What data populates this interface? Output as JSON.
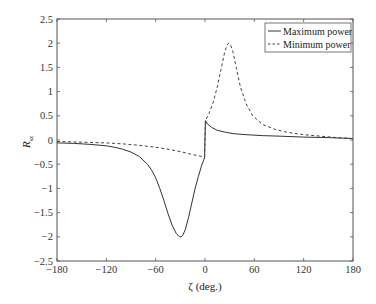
{
  "chart_data": {
    "type": "line",
    "title": "",
    "xlabel": "ζ (deg.)",
    "ylabel_main": "R",
    "ylabel_sub": "sz",
    "xlim": [
      -180,
      180
    ],
    "ylim": [
      -2.5,
      2.5
    ],
    "xticks": [
      -180,
      -120,
      -60,
      0,
      60,
      120,
      180
    ],
    "xtick_labels": [
      "−180",
      "−120",
      "−60",
      "0",
      "60",
      "120",
      "180"
    ],
    "yticks": [
      2.5,
      2,
      1.5,
      1,
      0.5,
      0,
      -0.5,
      -1,
      -1.5,
      -2,
      -2.5
    ],
    "ytick_labels": [
      "2.5",
      "2",
      "1.5",
      "1",
      "0.5",
      "0",
      "−0.5",
      "−1",
      "−1.5",
      "−2",
      "−2.5"
    ],
    "grid": false,
    "legend_position": "top-right",
    "series": [
      {
        "name": "Maximum power",
        "style": "solid",
        "color": "#333333",
        "points": [
          [
            -180,
            -0.06
          ],
          [
            -160,
            -0.07
          ],
          [
            -140,
            -0.09
          ],
          [
            -120,
            -0.12
          ],
          [
            -110,
            -0.15
          ],
          [
            -100,
            -0.19
          ],
          [
            -90,
            -0.25
          ],
          [
            -80,
            -0.34
          ],
          [
            -70,
            -0.5
          ],
          [
            -65,
            -0.62
          ],
          [
            -60,
            -0.78
          ],
          [
            -55,
            -1.0
          ],
          [
            -50,
            -1.25
          ],
          [
            -45,
            -1.52
          ],
          [
            -40,
            -1.76
          ],
          [
            -35,
            -1.93
          ],
          [
            -31,
            -2.0
          ],
          [
            -29,
            -2.0
          ],
          [
            -27,
            -1.97
          ],
          [
            -24,
            -1.85
          ],
          [
            -20,
            -1.6
          ],
          [
            -16,
            -1.3
          ],
          [
            -12,
            -1.0
          ],
          [
            -8,
            -0.75
          ],
          [
            -4,
            -0.52
          ],
          [
            -0.5,
            -0.37
          ],
          [
            0.5,
            0.4
          ],
          [
            3,
            0.33
          ],
          [
            8,
            0.26
          ],
          [
            15,
            0.2
          ],
          [
            25,
            0.16
          ],
          [
            35,
            0.13
          ],
          [
            50,
            0.11
          ],
          [
            70,
            0.09
          ],
          [
            90,
            0.08
          ],
          [
            120,
            0.06
          ],
          [
            150,
            0.05
          ],
          [
            180,
            0.03
          ]
        ]
      },
      {
        "name": "Minimum power",
        "style": "dashed",
        "color": "#444444",
        "points": [
          [
            -180,
            -0.03
          ],
          [
            -160,
            -0.04
          ],
          [
            -140,
            -0.05
          ],
          [
            -120,
            -0.06
          ],
          [
            -100,
            -0.08
          ],
          [
            -80,
            -0.11
          ],
          [
            -60,
            -0.15
          ],
          [
            -45,
            -0.19
          ],
          [
            -30,
            -0.24
          ],
          [
            -20,
            -0.28
          ],
          [
            -10,
            -0.32
          ],
          [
            -0.5,
            -0.35
          ],
          [
            0.5,
            0.4
          ],
          [
            5,
            0.55
          ],
          [
            10,
            0.78
          ],
          [
            15,
            1.1
          ],
          [
            20,
            1.5
          ],
          [
            24,
            1.82
          ],
          [
            27,
            1.97
          ],
          [
            29,
            2.0
          ],
          [
            31,
            1.97
          ],
          [
            34,
            1.82
          ],
          [
            38,
            1.5
          ],
          [
            43,
            1.1
          ],
          [
            50,
            0.75
          ],
          [
            58,
            0.5
          ],
          [
            70,
            0.32
          ],
          [
            85,
            0.22
          ],
          [
            100,
            0.16
          ],
          [
            120,
            0.11
          ],
          [
            140,
            0.08
          ],
          [
            160,
            0.05
          ],
          [
            180,
            0.03
          ]
        ]
      }
    ]
  }
}
